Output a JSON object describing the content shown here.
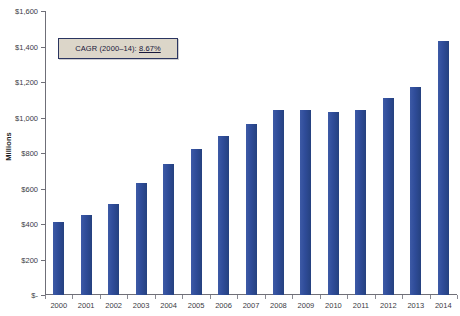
{
  "chart_data": {
    "type": "bar",
    "title": "",
    "xlabel": "",
    "ylabel": "Millions",
    "categories": [
      "2000",
      "2001",
      "2002",
      "2003",
      "2004",
      "2005",
      "2006",
      "2007",
      "2008",
      "2009",
      "2010",
      "2011",
      "2012",
      "2013",
      "2014"
    ],
    "values": [
      412,
      450,
      515,
      630,
      740,
      820,
      895,
      965,
      1045,
      1045,
      1030,
      1045,
      1110,
      1170,
      1430
    ],
    "series": [
      {
        "name": "Revenue",
        "values": [
          412,
          450,
          515,
          630,
          740,
          820,
          895,
          965,
          1045,
          1045,
          1030,
          1045,
          1110,
          1170,
          1430
        ]
      }
    ],
    "ylim": [
      0,
      1600
    ],
    "ytick_values": [
      0,
      200,
      400,
      600,
      800,
      1000,
      1200,
      1400,
      1600
    ],
    "ytick_labels": [
      "$-",
      "$200",
      "$400",
      "$600",
      "$800",
      "$1,000",
      "$1,200",
      "$1,400",
      "$1,600"
    ],
    "xtick_labels": [
      "2000",
      "2001",
      "2002",
      "2003",
      "2004",
      "2005",
      "2006",
      "2007",
      "2008",
      "2009",
      "2010",
      "2011",
      "2012",
      "2013",
      "2014"
    ],
    "grid": false,
    "legend": null,
    "bar_color": "#33509e",
    "annotations": [
      {
        "id": "cagr-callout",
        "label": "CAGR (2000–14):",
        "value": "8.67%",
        "full_text": "CAGR (2000–14): 8.67%",
        "box_fill": "#dcd6c9",
        "box_border": "#2b3560",
        "value_underlined": true
      }
    ]
  },
  "axis": {
    "y_title": "Millions"
  },
  "cagr": {
    "label": "CAGR (2000–14):",
    "value": "8.67%"
  },
  "header": {
    "title": ""
  }
}
